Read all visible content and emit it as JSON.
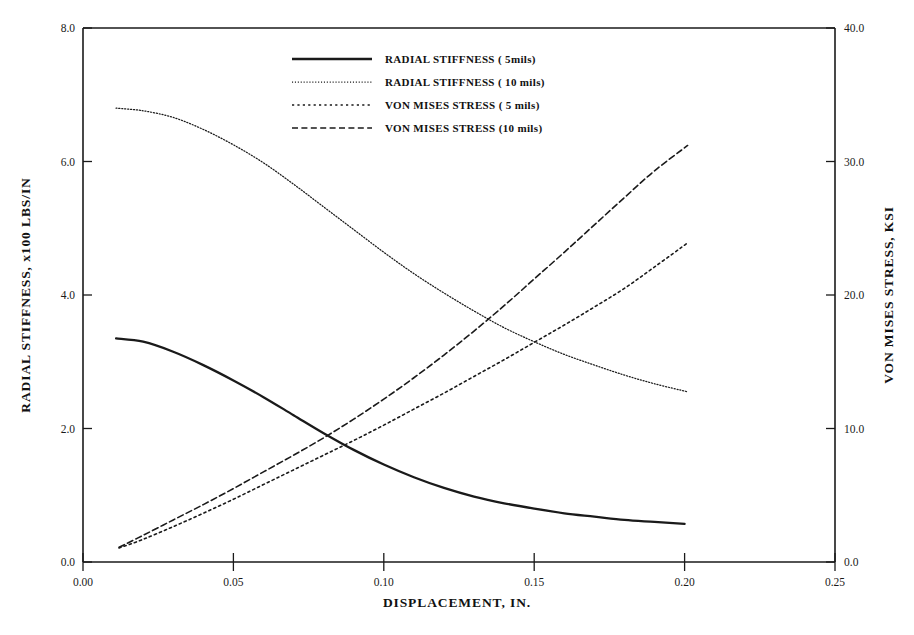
{
  "chart_data": {
    "type": "line",
    "title": "",
    "xlabel": "DISPLACEMENT,  IN.",
    "ylabel": "RADIAL STIFFNESS,  x100   LBS/IN",
    "ylabel_right": "VON MISES STRESS,   KSI",
    "xlim": [
      0.0,
      0.25
    ],
    "ylim": [
      0.0,
      8.0
    ],
    "ylim_right": [
      0.0,
      40.0
    ],
    "grid": false,
    "legend_position": "top-center",
    "x_ticks": [
      "0.00",
      "0.05",
      "0.10",
      "0.15",
      "0.20",
      "0.25"
    ],
    "x_tick_values": [
      0.0,
      0.05,
      0.1,
      0.15,
      0.2,
      0.25
    ],
    "y_ticks": [
      "0.0",
      "2.0",
      "4.0",
      "6.0",
      "8.0"
    ],
    "y_tick_values": [
      0.0,
      2.0,
      4.0,
      6.0,
      8.0
    ],
    "y_ticks_right": [
      "0.0",
      "10.0",
      "20.0",
      "30.0",
      "40.0"
    ],
    "y_tick_values_right": [
      0.0,
      10.0,
      20.0,
      30.0,
      40.0
    ],
    "series": [
      {
        "name": "RADIAL STIFFNESS ( 5mils)",
        "axis": "left",
        "style": "solid",
        "x": [
          0.011,
          0.02,
          0.03,
          0.04,
          0.05,
          0.06,
          0.07,
          0.08,
          0.09,
          0.1,
          0.11,
          0.12,
          0.13,
          0.14,
          0.15,
          0.16,
          0.17,
          0.18,
          0.19,
          0.2
        ],
        "values": [
          3.35,
          3.3,
          3.15,
          2.95,
          2.72,
          2.47,
          2.2,
          1.93,
          1.68,
          1.46,
          1.27,
          1.11,
          0.98,
          0.88,
          0.8,
          0.73,
          0.68,
          0.63,
          0.6,
          0.57
        ]
      },
      {
        "name": "RADIAL STIFFNESS ( 10 mils)",
        "axis": "left",
        "style": "fine-dotted",
        "x": [
          0.011,
          0.02,
          0.03,
          0.04,
          0.05,
          0.06,
          0.07,
          0.08,
          0.09,
          0.1,
          0.11,
          0.12,
          0.13,
          0.14,
          0.15,
          0.16,
          0.17,
          0.18,
          0.19,
          0.201
        ],
        "values": [
          6.8,
          6.76,
          6.66,
          6.48,
          6.25,
          5.98,
          5.66,
          5.32,
          4.98,
          4.64,
          4.32,
          4.03,
          3.76,
          3.51,
          3.3,
          3.11,
          2.95,
          2.8,
          2.67,
          2.55
        ]
      },
      {
        "name": "VON MISES STRESS ( 5 mils)",
        "axis": "right",
        "style": "dotted",
        "x": [
          0.012,
          0.02,
          0.03,
          0.04,
          0.05,
          0.06,
          0.07,
          0.08,
          0.09,
          0.1,
          0.11,
          0.12,
          0.13,
          0.14,
          0.15,
          0.16,
          0.17,
          0.18,
          0.19,
          0.201
        ],
        "values": [
          1.05,
          1.7,
          2.65,
          3.65,
          4.7,
          5.8,
          6.9,
          8.0,
          9.1,
          10.25,
          11.45,
          12.65,
          13.9,
          15.15,
          16.45,
          17.75,
          19.1,
          20.5,
          22.1,
          23.9
        ]
      },
      {
        "name": "VON MISES STRESS (10 mils)",
        "axis": "right",
        "style": "dashed",
        "x": [
          0.012,
          0.02,
          0.03,
          0.04,
          0.05,
          0.06,
          0.07,
          0.08,
          0.09,
          0.1,
          0.11,
          0.12,
          0.13,
          0.14,
          0.15,
          0.16,
          0.17,
          0.18,
          0.19,
          0.201
        ],
        "values": [
          1.1,
          2.0,
          3.15,
          4.3,
          5.5,
          6.75,
          8.0,
          9.3,
          10.7,
          12.2,
          13.8,
          15.5,
          17.3,
          19.2,
          21.2,
          23.2,
          25.25,
          27.3,
          29.3,
          31.2
        ]
      }
    ],
    "legend": [
      {
        "label": "RADIAL STIFFNESS ( 5mils)",
        "style": "solid"
      },
      {
        "label": "RADIAL STIFFNESS ( 10 mils)",
        "style": "fine-dotted"
      },
      {
        "label": "VON MISES STRESS ( 5 mils)",
        "style": "dotted"
      },
      {
        "label": "VON MISES STRESS (10 mils)",
        "style": "dashed"
      }
    ]
  },
  "colors": {
    "ink": "#1a1a1a",
    "background": "#ffffff"
  }
}
